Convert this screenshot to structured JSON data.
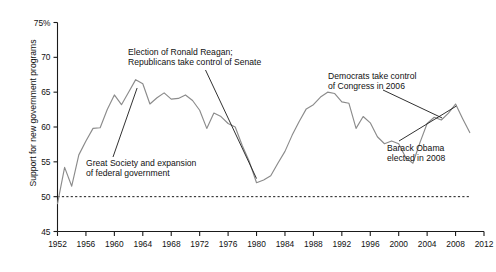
{
  "chart_data": {
    "type": "line",
    "title": "",
    "xlabel": "",
    "ylabel": "Support for new government programs",
    "xlim": [
      1952,
      2012
    ],
    "ylim": [
      45,
      75
    ],
    "grid": false,
    "legend": null,
    "y_ticks": [
      45,
      50,
      55,
      60,
      65,
      70,
      75
    ],
    "y_tick_labels": [
      "45",
      "50",
      "55",
      "60",
      "65",
      "70",
      "75%"
    ],
    "x_ticks": [
      1952,
      1956,
      1960,
      1964,
      1968,
      1972,
      1976,
      1980,
      1984,
      1988,
      1992,
      1996,
      2000,
      2004,
      2008,
      2012
    ],
    "x_tick_labels": [
      "1952",
      "1956",
      "1960",
      "1964",
      "1968",
      "1972",
      "1976",
      "1980",
      "1984",
      "1988",
      "1992",
      "1996",
      "2000",
      "2004",
      "2008",
      "2012"
    ],
    "reference_line": {
      "value": 50,
      "style": "dashed",
      "label": ""
    },
    "series": [
      {
        "name": "Support for new government programs",
        "color": "#8b8b8b",
        "x": [
          1952,
          1953,
          1954,
          1955,
          1956,
          1957,
          1958,
          1959,
          1960,
          1961,
          1962,
          1963,
          1964,
          1965,
          1966,
          1967,
          1968,
          1969,
          1970,
          1971,
          1972,
          1973,
          1974,
          1975,
          1976,
          1977,
          1978,
          1979,
          1980,
          1981,
          1982,
          1983,
          1984,
          1985,
          1986,
          1987,
          1988,
          1989,
          1990,
          1991,
          1992,
          1993,
          1994,
          1995,
          1996,
          1997,
          1998,
          1999,
          2000,
          2001,
          2002,
          2003,
          2004,
          2005,
          2006,
          2007,
          2008,
          2009,
          2010
        ],
        "y": [
          49.0,
          54.2,
          51.5,
          56.0,
          58.0,
          59.8,
          59.9,
          62.5,
          64.6,
          63.2,
          65.0,
          66.8,
          66.2,
          63.3,
          64.2,
          64.9,
          64.0,
          64.1,
          64.6,
          63.8,
          62.4,
          59.8,
          62.0,
          61.5,
          60.5,
          60.0,
          57.3,
          55.0,
          52.0,
          52.4,
          53.0,
          54.8,
          56.5,
          58.8,
          60.8,
          62.6,
          63.2,
          64.3,
          65.0,
          64.8,
          63.6,
          63.4,
          59.8,
          61.5,
          60.6,
          58.6,
          57.6,
          58.0,
          57.6,
          55.6,
          54.8,
          57.8,
          60.5,
          61.4,
          61.0,
          62.0,
          63.3,
          61.2,
          59.2
        ]
      }
    ],
    "annotations": [
      {
        "id": "great-society",
        "text": "Great Society and expansion\nof federal government",
        "points_to_year": 1963,
        "points_to_value": 66.0
      },
      {
        "id": "reagan",
        "text": "Election of Ronald Reagan;\nRepublicans take control of Senate",
        "points_to_year": 1980,
        "points_to_value": 52.0
      },
      {
        "id": "democrats",
        "text": "Democrats take control\nof Congress in 2006",
        "points_to_year": 2006,
        "points_to_value": 61.0
      },
      {
        "id": "obama",
        "text": "Barack Obama\nelected in 2008",
        "points_to_year": 2008,
        "points_to_value": 63.3
      }
    ]
  },
  "axis": {
    "y_title": "Support for new government programs"
  }
}
